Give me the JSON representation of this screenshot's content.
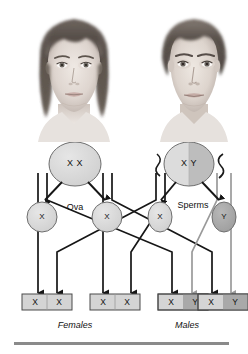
{
  "figure": {
    "bottom_rule_color": "#8a8a8a"
  },
  "portraits": [
    {
      "name": "female-parent-photo",
      "alt": "Female parent portrait",
      "sex": "female"
    },
    {
      "name": "male-parent-photo",
      "alt": "Male parent portrait",
      "sex": "male"
    }
  ],
  "parents": {
    "mother": {
      "label": "X X",
      "allele_left": "X",
      "allele_right": "X",
      "fill_left": "#d8d8d8",
      "fill_right": "#d8d8d8",
      "stroke": "#6d6d6d"
    },
    "father": {
      "label": "X Y",
      "allele_left": "X",
      "allele_right": "Y",
      "fill_left": "#dcdcdc",
      "fill_right": "#bdbdbd",
      "stroke": "#6d6d6d"
    }
  },
  "gametes": {
    "ova_label": "Ova",
    "sperms_label": "Sperms",
    "ova": [
      {
        "allele": "X",
        "fill": "#d8d8d8",
        "stroke": "#6d6d6d"
      },
      {
        "allele": "X",
        "fill": "#d8d8d8",
        "stroke": "#6d6d6d"
      }
    ],
    "sperms": [
      {
        "allele": "X",
        "fill": "#dcdcdc",
        "stroke": "#6d6d6d"
      },
      {
        "allele": "Y",
        "fill": "#a9a9a9",
        "stroke": "#6d6d6d"
      }
    ]
  },
  "offspring": [
    {
      "left": "X",
      "right": "X",
      "sex": "female",
      "left_fill": "#d4d4d4",
      "right_fill": "#d4d4d4"
    },
    {
      "left": "X",
      "right": "X",
      "sex": "female",
      "left_fill": "#d4d4d4",
      "right_fill": "#d4d4d4"
    },
    {
      "left": "X",
      "right": "Y",
      "sex": "male",
      "left_fill": "#d4d4d4",
      "right_fill": "#a9a9a9"
    },
    {
      "left": "X",
      "right": "Y",
      "sex": "male",
      "left_fill": "#d4d4d4",
      "right_fill": "#a9a9a9"
    }
  ],
  "captions": {
    "females": "Females",
    "males": "Males"
  },
  "colors": {
    "arrow_black": "#161616",
    "arrow_gray": "#9a9a9a",
    "box_stroke": "#4a4a4a",
    "cell_stroke": "#6d6d6d"
  }
}
